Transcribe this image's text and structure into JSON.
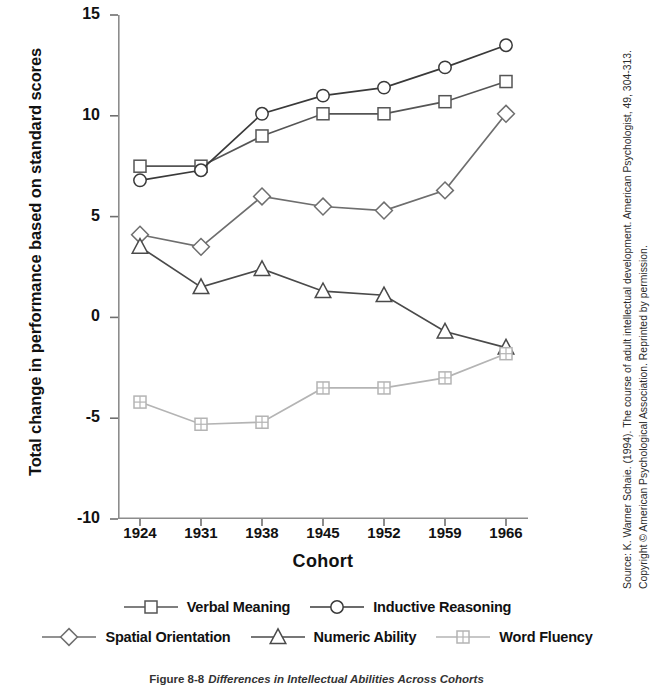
{
  "chart_data": {
    "type": "line",
    "title": "",
    "xlabel": "Cohort",
    "ylabel": "Total change in performance based on standard scores",
    "categories": [
      "1924",
      "1931",
      "1938",
      "1945",
      "1952",
      "1959",
      "1966"
    ],
    "x": [
      1924,
      1931,
      1938,
      1945,
      1952,
      1959,
      1966
    ],
    "xlim": [
      1920.5,
      1969.5
    ],
    "ylim": [
      -10,
      15
    ],
    "yticks": [
      -10,
      -5,
      0,
      5,
      10,
      15
    ],
    "yticklabels": [
      "-10",
      "-5",
      "0",
      "5",
      "10",
      "15"
    ],
    "grid": false,
    "legend_position": "below-axes",
    "series": [
      {
        "name": "Verbal Meaning",
        "marker": "square",
        "color": "#555555",
        "values": [
          7.5,
          7.5,
          9.0,
          10.1,
          10.1,
          10.7,
          11.7
        ]
      },
      {
        "name": "Inductive Reasoning",
        "marker": "circle",
        "color": "#3a3a3a",
        "values": [
          6.8,
          7.3,
          10.1,
          11.0,
          11.4,
          12.4,
          13.5
        ]
      },
      {
        "name": "Spatial Orientation",
        "marker": "diamond",
        "color": "#6e6e6e",
        "values": [
          4.1,
          3.5,
          6.0,
          5.5,
          5.3,
          6.3,
          10.1
        ]
      },
      {
        "name": "Numeric Ability",
        "marker": "triangle",
        "color": "#4a4a4a",
        "values": [
          3.5,
          1.5,
          2.4,
          1.3,
          1.1,
          -0.7,
          -1.5
        ]
      },
      {
        "name": "Word Fluency",
        "marker": "grid-square",
        "color": "#b4b4b4",
        "values": [
          -4.2,
          -5.3,
          -5.2,
          -3.5,
          -3.5,
          -3.0,
          -1.8
        ]
      }
    ]
  },
  "legend": {
    "row1": [
      {
        "label": "Verbal Meaning",
        "marker": "square"
      },
      {
        "label": "Inductive Reasoning",
        "marker": "circle"
      }
    ],
    "row2": [
      {
        "label": "Spatial Orientation",
        "marker": "diamond"
      },
      {
        "label": "Numeric Ability",
        "marker": "triangle"
      },
      {
        "label": "Word Fluency",
        "marker": "grid-square"
      }
    ]
  },
  "source": {
    "text": "Source: K. Warner Schaie. (1994). The course of adult intellectual development. American Psychologist, 49, 304-313. Copyright © American Psychological Association. Reprinted by permission."
  },
  "caption": {
    "number": "Figure 8-8",
    "text": "Differences in Intellectual Abilities Across Cohorts"
  }
}
